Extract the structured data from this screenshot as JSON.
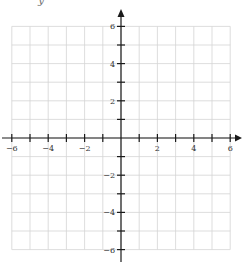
{
  "chart_data": {
    "type": "coordinate-plane",
    "title": "",
    "xlabel": "",
    "ylabel": "y",
    "xlim": [
      -6,
      6
    ],
    "ylim": [
      -6,
      6
    ],
    "grid": true,
    "grid_step": 1,
    "tick_step": 1,
    "x_tick_labels": [
      "-6",
      "-4",
      "-2",
      "2",
      "4",
      "6"
    ],
    "x_tick_label_values": [
      -6,
      -4,
      -2,
      2,
      4,
      6
    ],
    "y_tick_labels": [
      "6",
      "4",
      "2",
      "-2",
      "-4",
      "-6"
    ],
    "y_tick_label_values": [
      6,
      4,
      2,
      -2,
      -4,
      -6
    ],
    "arrows": [
      "positive-x",
      "positive-y"
    ],
    "series": []
  },
  "colors": {
    "grid": "#d4d4d4",
    "axis": "#1a1a1a",
    "label": "#333333"
  }
}
